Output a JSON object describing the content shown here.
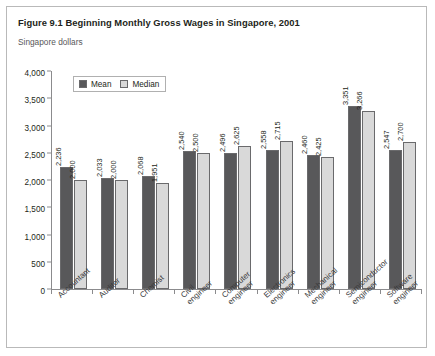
{
  "figure": {
    "title": "Figure 9.1 Beginning Monthly Gross Wages in Singapore, 2001",
    "unit_label": "Singapore dollars"
  },
  "legend": {
    "mean_label": "Mean",
    "median_label": "Median"
  },
  "colors": {
    "mean": "#58585a",
    "median": "#d9d9d9",
    "bar_outline": "#6a6a6c",
    "axis": "#8b8b8d",
    "frame": "#b9b9b9",
    "text": "#231f20"
  },
  "chart_data": {
    "type": "bar",
    "title": "Figure 9.1 Beginning Monthly Gross Wages in Singapore, 2001",
    "subtitle": "Singapore dollars",
    "xlabel": "",
    "ylabel": "Singapore dollars",
    "ylim": [
      0,
      4000
    ],
    "ytick_labels": [
      "0",
      "500",
      "1,000",
      "1,500",
      "2,000",
      "2,500",
      "3,000",
      "3,500",
      "4,000"
    ],
    "ytick_values": [
      0,
      500,
      1000,
      1500,
      2000,
      2500,
      3000,
      3500,
      4000
    ],
    "grid": false,
    "legend_position": "top-left",
    "categories": [
      "Accountant",
      "Auditor",
      "Chemist",
      "Civil engineer",
      "Computer engineer",
      "Electronics engineer",
      "Mechanical engineer",
      "Semiconductor engineer",
      "Software engineer"
    ],
    "category_lines": [
      [
        "Accountant",
        ""
      ],
      [
        "Auditor",
        ""
      ],
      [
        "Chemist",
        ""
      ],
      [
        "Civil",
        "engineer"
      ],
      [
        "Computer",
        "engineer"
      ],
      [
        "Electronics",
        "engineer"
      ],
      [
        "Mechanical",
        "engineer"
      ],
      [
        "Semiconductor",
        "engineer"
      ],
      [
        "Software",
        "engineer"
      ]
    ],
    "series": [
      {
        "name": "Mean",
        "values": [
          2236,
          2033,
          2068,
          2540,
          2496,
          2558,
          2460,
          3351,
          2547
        ],
        "labels": [
          "2,236",
          "2,033",
          "2,068",
          "2,540",
          "2,496",
          "2,558",
          "2,460",
          "3,351",
          "2,547"
        ]
      },
      {
        "name": "Median",
        "values": [
          2000,
          2000,
          1951,
          2500,
          2625,
          2715,
          2425,
          3266,
          2700
        ],
        "labels": [
          "2,000",
          "2,000",
          "1,951",
          "2,500",
          "2,625",
          "2,715",
          "2,425",
          "3,266",
          "2,700"
        ]
      }
    ]
  }
}
